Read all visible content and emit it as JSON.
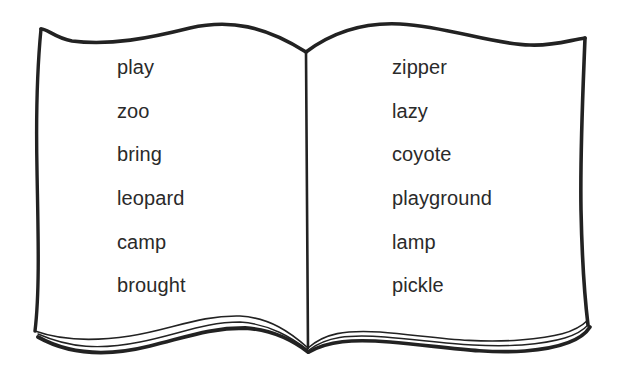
{
  "illustration": {
    "subject": "open book word list",
    "stroke_color": "#222222",
    "page_color": "#ffffff"
  },
  "left_page": {
    "words": [
      "play",
      "zoo",
      "bring",
      "leopard",
      "camp",
      "brought"
    ]
  },
  "right_page": {
    "words": [
      "zipper",
      "lazy",
      "coyote",
      "playground",
      "lamp",
      "pickle"
    ]
  }
}
